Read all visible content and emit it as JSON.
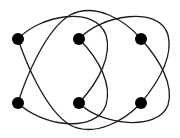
{
  "diagram": {
    "type": "graph",
    "colors": {
      "background": "#ffffff",
      "edge": "#1a1a1a",
      "node": "#000000"
    },
    "nodes": [
      {
        "id": "top-left",
        "x": 18,
        "y": 39
      },
      {
        "id": "top-middle",
        "x": 79,
        "y": 39
      },
      {
        "id": "top-right",
        "x": 141,
        "y": 39
      },
      {
        "id": "bottom-left",
        "x": 18,
        "y": 103
      },
      {
        "id": "bottom-middle",
        "x": 79,
        "y": 103
      },
      {
        "id": "bottom-right",
        "x": 141,
        "y": 103
      }
    ],
    "edges": [
      {
        "from": "top-left",
        "to": "bottom-middle"
      },
      {
        "from": "top-left",
        "to": "bottom-right"
      },
      {
        "from": "top-middle",
        "to": "bottom-left"
      },
      {
        "from": "top-middle",
        "to": "bottom-right"
      },
      {
        "from": "top-right",
        "to": "bottom-left"
      },
      {
        "from": "top-right",
        "to": "bottom-middle"
      }
    ]
  }
}
